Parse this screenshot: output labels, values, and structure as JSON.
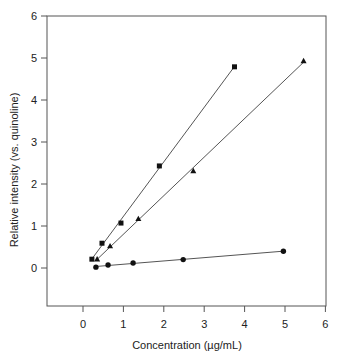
{
  "chart_data": {
    "type": "scatter",
    "title": "",
    "xlabel": "Concentration (µg/mL)",
    "ylabel": "Relative intensity (vs. quinoline)",
    "xlim": [
      -0.9,
      6
    ],
    "ylim": [
      -0.9,
      6
    ],
    "xticks": [
      0,
      1,
      2,
      3,
      4,
      5,
      6
    ],
    "yticks": [
      0,
      1,
      2,
      3,
      4,
      5,
      6
    ],
    "grid": false,
    "legend": null,
    "series": [
      {
        "name": "squares",
        "marker": "square",
        "fit_line": true,
        "points": [
          [
            0.22,
            0.21
          ],
          [
            0.47,
            0.59
          ],
          [
            0.94,
            1.07
          ],
          [
            1.89,
            2.43
          ],
          [
            3.75,
            4.79
          ]
        ]
      },
      {
        "name": "triangles",
        "marker": "triangle",
        "fit_line": true,
        "points": [
          [
            0.35,
            0.21
          ],
          [
            0.67,
            0.52
          ],
          [
            1.37,
            1.17
          ],
          [
            2.73,
            2.31
          ],
          [
            5.46,
            4.93
          ]
        ]
      },
      {
        "name": "circles",
        "marker": "circle",
        "fit_line": true,
        "points": [
          [
            0.32,
            0.02
          ],
          [
            0.62,
            0.07
          ],
          [
            1.24,
            0.12
          ],
          [
            2.48,
            0.2
          ],
          [
            4.96,
            0.4
          ]
        ]
      }
    ]
  },
  "colors": {
    "axis": "#555555",
    "line": "#555555",
    "marker": "#111111"
  }
}
